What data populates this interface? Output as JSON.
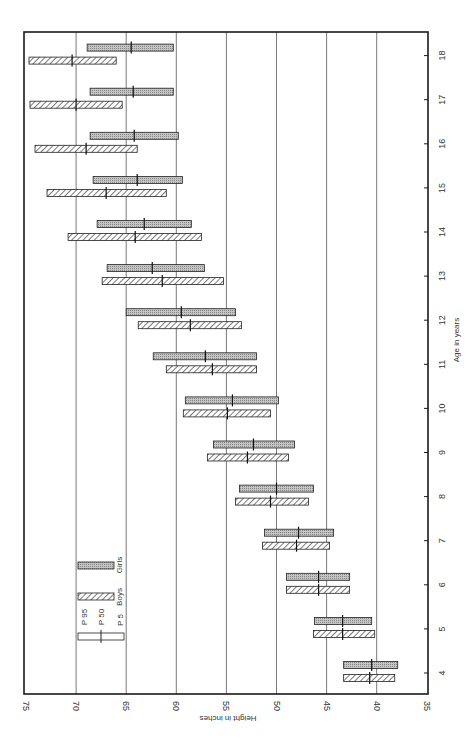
{
  "chart_data": {
    "type": "bar",
    "subtype": "floating-range (P5–P95 with P50 marker), rotated 90° clockwise",
    "title": "",
    "xlabel": "Age in years",
    "ylabel": "Height in inches",
    "ylim": [
      35,
      75
    ],
    "y_ticks": [
      75,
      70,
      65,
      60,
      55,
      50,
      45,
      40,
      35
    ],
    "categories": [
      4,
      5,
      6,
      7,
      8,
      9,
      10,
      11,
      12,
      13,
      14,
      15,
      16,
      17,
      18
    ],
    "grid": true,
    "legend": {
      "position": "lower-left (rotated)",
      "entries": [
        "Girls",
        "Boys"
      ],
      "percentile_labels": [
        "P 95",
        "P 50",
        "P 5"
      ]
    },
    "series": [
      {
        "name": "Girls",
        "pattern": "stippled gray",
        "p5": [
          37.9,
          40.5,
          42.7,
          44.3,
          46.3,
          48.2,
          49.8,
          52.0,
          54.1,
          57.2,
          58.5,
          59.4,
          59.8,
          60.3,
          60.3
        ],
        "p50": [
          40.5,
          43.4,
          45.8,
          47.8,
          50.0,
          52.3,
          54.4,
          57.1,
          59.5,
          62.4,
          63.2,
          63.9,
          64.2,
          64.3,
          64.5
        ],
        "p95": [
          43.3,
          46.2,
          49.0,
          51.2,
          53.7,
          56.3,
          59.1,
          62.3,
          65.0,
          66.9,
          67.9,
          68.3,
          68.6,
          68.6,
          68.9
        ]
      },
      {
        "name": "Boys",
        "pattern": "diagonal hatch",
        "p5": [
          38.2,
          40.2,
          42.7,
          44.7,
          46.8,
          48.8,
          50.6,
          52.0,
          53.5,
          55.3,
          57.5,
          61.0,
          63.9,
          65.4,
          66.0
        ],
        "p50": [
          40.7,
          43.4,
          45.8,
          48.0,
          50.6,
          52.9,
          54.9,
          56.4,
          58.6,
          61.4,
          64.1,
          67.0,
          69.0,
          70.0,
          70.4
        ],
        "p95": [
          43.3,
          46.3,
          49.0,
          51.4,
          54.1,
          56.9,
          59.3,
          61.0,
          63.8,
          67.4,
          70.8,
          72.9,
          74.1,
          74.6,
          74.7
        ]
      }
    ]
  },
  "labels": {
    "x_axis_title": "Age in years",
    "y_axis_title": "Height in inches",
    "legend_girls": "Girls",
    "legend_boys": "Boys",
    "legend_p95": "P 95",
    "legend_p50": "P 50",
    "legend_p5": "P 5"
  },
  "colors": {
    "frame": "#1a1a1a",
    "grid": "#555555",
    "girls_fill": "#b8b8b8",
    "boys_hatch": "#333333",
    "text": "#333333"
  }
}
